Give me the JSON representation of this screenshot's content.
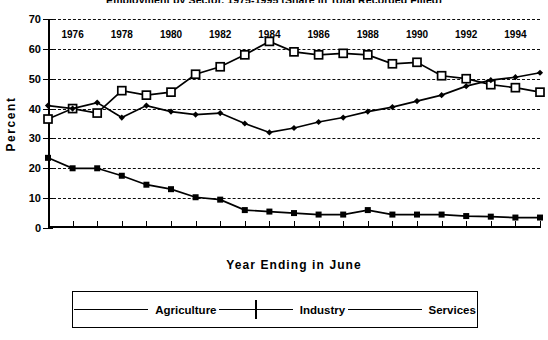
{
  "chart_data": {
    "type": "line",
    "title": "Employment by Sector, 1975-1995 (Share in Total Recorded Filled)",
    "xlabel": "Year Ending in June",
    "ylabel": "Percent",
    "ylim": [
      0,
      70
    ],
    "yticks": [
      0,
      10,
      20,
      30,
      40,
      50,
      60,
      70
    ],
    "xlim": [
      1975,
      1995
    ],
    "xticks": [
      1975,
      1976,
      1977,
      1978,
      1979,
      1980,
      1981,
      1982,
      1983,
      1984,
      1985,
      1986,
      1987,
      1988,
      1989,
      1990,
      1991,
      1992,
      1993,
      1994,
      1995
    ],
    "xtick_labels": [
      "",
      "1976",
      "",
      "1978",
      "",
      "1980",
      "",
      "1982",
      "",
      "1984",
      "",
      "1986",
      "",
      "1988",
      "",
      "1990",
      "",
      "1992",
      "",
      "1994",
      ""
    ],
    "grid": "horizontal-dashed",
    "legend_position": "bottom",
    "x": [
      1975,
      1976,
      1977,
      1978,
      1979,
      1980,
      1981,
      1982,
      1983,
      1984,
      1985,
      1986,
      1987,
      1988,
      1989,
      1990,
      1991,
      1992,
      1993,
      1994,
      1995
    ],
    "series": [
      {
        "name": "Agriculture",
        "marker": "filled-square",
        "color": "#000000",
        "values": [
          23.5,
          20.0,
          20.0,
          17.5,
          14.5,
          13.0,
          10.3,
          9.5,
          6.0,
          5.5,
          5.0,
          4.5,
          4.5,
          6.0,
          4.5,
          4.5,
          4.5,
          4.0,
          3.8,
          3.5,
          3.5
        ]
      },
      {
        "name": "Industry",
        "marker": "open-square",
        "color": "#000000",
        "values": [
          36.5,
          40.0,
          38.5,
          46.0,
          44.5,
          45.5,
          51.5,
          54.0,
          58.0,
          62.5,
          59.0,
          58.0,
          58.5,
          58.0,
          55.0,
          55.5,
          51.0,
          50.0,
          48.0,
          47.0,
          45.5
        ]
      },
      {
        "name": "Services",
        "marker": "diamond",
        "color": "#000000",
        "values": [
          41.0,
          40.0,
          42.0,
          37.0,
          41.0,
          39.0,
          38.0,
          38.5,
          35.0,
          32.0,
          33.5,
          35.5,
          37.0,
          39.0,
          40.5,
          42.5,
          44.5,
          47.5,
          49.5,
          50.5,
          52.0
        ]
      }
    ]
  },
  "legend": {
    "items": [
      {
        "label": "Agriculture",
        "marker": "filled-square-icon"
      },
      {
        "label": "Industry",
        "marker": "open-square-icon"
      },
      {
        "label": "Services",
        "marker": "diamond-icon"
      }
    ]
  }
}
